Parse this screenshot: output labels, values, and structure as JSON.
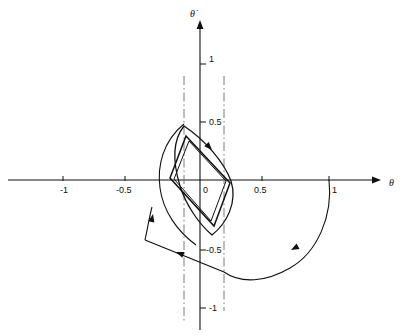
{
  "figure": {
    "type": "phase-plane-diagram",
    "background": "#ffffff",
    "stroke_color": "#101010",
    "width": 403,
    "height": 336
  },
  "axes": {
    "x_axis": {
      "name": "theta-axis",
      "label": "θ",
      "label_x": 389,
      "label_y": 186,
      "y_pixel": 180,
      "x_start": 8,
      "x_end": 381,
      "arrow": "right"
    },
    "y_axis": {
      "name": "theta-dot-axis",
      "label": "θ̇",
      "label_x": 190,
      "label_y": 17,
      "x_pixel": 200,
      "y_start": 330,
      "y_end": 20,
      "arrow": "up"
    },
    "origin": {
      "x": 200,
      "y": 180
    },
    "scale": {
      "x_unit_px": 124,
      "y_unit_px": 116
    }
  },
  "ticks": {
    "x": [
      {
        "value": "-1",
        "px": 63,
        "label_x": 60,
        "label_y": 193
      },
      {
        "value": "-0.5",
        "px": 125,
        "label_x": 116,
        "label_y": 193
      },
      {
        "value": "0",
        "px": 200,
        "label_x": 203,
        "label_y": 193
      },
      {
        "value": "0.5",
        "px": 262,
        "label_x": 254,
        "label_y": 193
      },
      {
        "value": "1",
        "px": 329,
        "label_x": 332,
        "label_y": 193
      }
    ],
    "y": [
      {
        "value": "1",
        "px": 64,
        "label_x": 209,
        "label_y": 62
      },
      {
        "value": "0.5",
        "px": 122,
        "label_x": 209,
        "label_y": 125
      },
      {
        "value": "-0.5",
        "px": 250,
        "label_x": 206,
        "label_y": 253
      },
      {
        "value": "-1",
        "px": 308,
        "label_x": 209,
        "label_y": 311
      }
    ]
  },
  "switching_lines": [
    {
      "name": "left-switching-line",
      "x": 184,
      "y_top": 76,
      "y_bottom": 321
    },
    {
      "name": "right-switching-line",
      "x": 224,
      "y_top": 76,
      "y_bottom": 311
    }
  ],
  "trajectories": {
    "limit_cycle": {
      "name": "inner-limit-cycle",
      "description": "parallelogram limit cycle, clockwise",
      "points": "186,136 230,183 214,226 170,178",
      "offset_points": "189,141 226,181 211,221 174,179"
    },
    "inner_lens": {
      "name": "inner-lens-trajectory",
      "description": "lens shaped spiral outside the limit cycle",
      "path": "M184,126 C205,140 224,162 231,181 C238,203 226,224 212,235 C199,224 186,205 180,186 C173,163 172,141 184,126 Z"
    },
    "outer_lens": {
      "name": "outer-lens-trajectory",
      "description": "outer lens shaped spiral arc",
      "path": "M184,124 C163,141 157,166 160,188 C163,211 177,231 196,245"
    },
    "outer_arc": {
      "name": "outer-divergent-trajectory",
      "description": "trajectory from theta = 1 curving down and left",
      "path": "M329,180 C333,215 318,252 290,268 C266,282 241,284 224,272"
    },
    "lower_left_segment": {
      "name": "lower-left-segment",
      "description": "straight segment from lower corner up to the left",
      "path": "M224,272 L145,240"
    },
    "left_riser": {
      "name": "left-riser-segment",
      "description": "segment rising from lower left toward the lens",
      "path": "M145,240 C148,226 150,214 152,207"
    }
  },
  "arrowheads": [
    {
      "name": "arrow-limit-cycle-upper-right",
      "x": 212,
      "y": 150,
      "angle": 47,
      "direction": "down-right"
    },
    {
      "name": "arrow-outer-lens-left",
      "x": 153,
      "y": 214,
      "angle": -78,
      "direction": "up"
    },
    {
      "name": "arrow-lower-left-segment",
      "x": 176,
      "y": 252,
      "angle": 202,
      "direction": "up-left"
    },
    {
      "name": "arrow-outer-arc",
      "x": 291,
      "y": 250,
      "angle": 152,
      "direction": "left-down"
    }
  ]
}
